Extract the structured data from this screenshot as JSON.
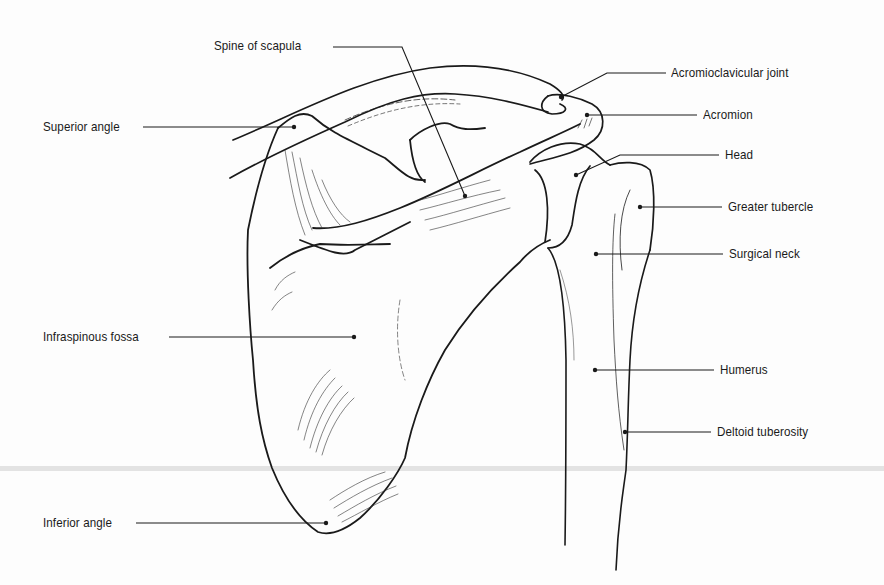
{
  "figure": {
    "line_color": "#1a1a1a",
    "background": "#fdfdfd"
  },
  "labels": [
    {
      "id": "spine-of-scapula",
      "text": "Spine of scapula",
      "x": 214,
      "y": 45
    },
    {
      "id": "superior-angle",
      "text": "Superior angle",
      "x": 43,
      "y": 118
    },
    {
      "id": "acromioclavicular-joint",
      "text": "Acromioclavicular joint",
      "x": 671,
      "y": 64
    },
    {
      "id": "acromion",
      "text": "Acromion",
      "x": 703,
      "y": 107
    },
    {
      "id": "head",
      "text": "Head",
      "x": 725,
      "y": 148
    },
    {
      "id": "greater-tubercle",
      "text": "Greater tubercle",
      "x": 728,
      "y": 199
    },
    {
      "id": "surgical-neck",
      "text": "Surgical neck",
      "x": 729,
      "y": 246
    },
    {
      "id": "infraspinous-fossa",
      "text": "Infraspinous fossa",
      "x": 43,
      "y": 328
    },
    {
      "id": "humerus",
      "text": "Humerus",
      "x": 720,
      "y": 362
    },
    {
      "id": "deltoid-tuberosity",
      "text": "Deltoid tuberosity",
      "x": 717,
      "y": 423
    },
    {
      "id": "inferior-angle",
      "text": "Inferior angle",
      "x": 43,
      "y": 514
    }
  ],
  "leaders": [
    {
      "id": "spine-of-scapula",
      "points": "333,47 402,47 465,196"
    },
    {
      "id": "superior-angle",
      "points": "143,127 294,127"
    },
    {
      "id": "acromioclavicular-joint",
      "points": "666,73 607,73 561,97"
    },
    {
      "id": "acromion",
      "points": "697,115 587,115"
    },
    {
      "id": "head",
      "points": "719,155 620,155 576,175"
    },
    {
      "id": "greater-tubercle",
      "points": "722,207 640,207"
    },
    {
      "id": "surgical-neck",
      "points": "723,254 596,254"
    },
    {
      "id": "infraspinous-fossa",
      "points": "169,337 354,337"
    },
    {
      "id": "humerus",
      "points": "714,370 595,370"
    },
    {
      "id": "deltoid-tuberosity",
      "points": "711,432 625,432"
    },
    {
      "id": "inferior-angle",
      "points": "136,523 326,523"
    }
  ],
  "dots": [
    {
      "id": "spine-of-scapula",
      "cx": 465,
      "cy": 196
    },
    {
      "id": "superior-angle",
      "cx": 294,
      "cy": 127
    },
    {
      "id": "acromioclavicular-joint",
      "cx": 561,
      "cy": 97
    },
    {
      "id": "acromion",
      "cx": 587,
      "cy": 115
    },
    {
      "id": "head",
      "cx": 576,
      "cy": 175
    },
    {
      "id": "greater-tubercle",
      "cx": 640,
      "cy": 207
    },
    {
      "id": "surgical-neck",
      "cx": 596,
      "cy": 254
    },
    {
      "id": "infraspinous-fossa",
      "cx": 354,
      "cy": 337
    },
    {
      "id": "humerus",
      "cx": 595,
      "cy": 370
    },
    {
      "id": "deltoid-tuberosity",
      "cx": 625,
      "cy": 432
    },
    {
      "id": "inferior-angle",
      "cx": 326,
      "cy": 523
    }
  ]
}
